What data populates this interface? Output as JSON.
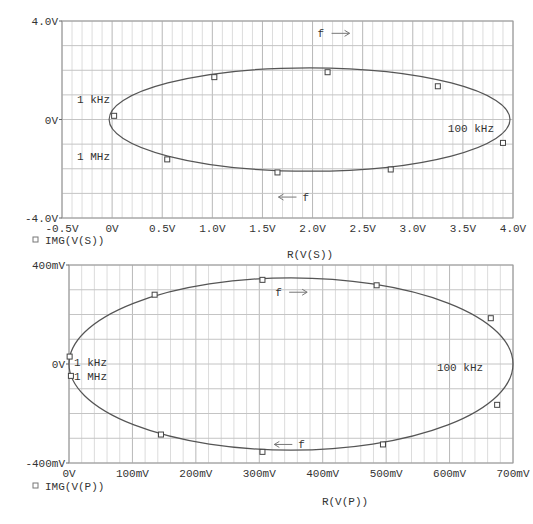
{
  "chart_data": [
    {
      "type": "scatter",
      "subtype": "parametric-nyquist-ellipse",
      "title": "",
      "xlabel": "R(V(S))",
      "ylabel": "",
      "legend": [
        {
          "marker": "square",
          "label": "IMG(V(S))"
        }
      ],
      "xlim": [
        -0.5,
        4.0
      ],
      "ylim": [
        -4.0,
        4.0
      ],
      "x_ticks": [
        "-0.5V",
        "0V",
        "0.5V",
        "1.0V",
        "1.5V",
        "2.0V",
        "2.5V",
        "3.0V",
        "3.5V",
        "4.0V"
      ],
      "y_ticks": [
        "4.0V",
        "0V",
        "-4.0V"
      ],
      "grid": true,
      "curve": {
        "cx": 1.97,
        "cy": 0.0,
        "rx": 2.0,
        "ry": 2.1
      },
      "markers": [
        {
          "x": 0.02,
          "y": 0.15
        },
        {
          "x": 1.02,
          "y": 1.72
        },
        {
          "x": 2.15,
          "y": 1.92
        },
        {
          "x": 3.25,
          "y": 1.35
        },
        {
          "x": 3.9,
          "y": -0.95
        },
        {
          "x": 2.78,
          "y": -2.03
        },
        {
          "x": 1.65,
          "y": -2.15
        },
        {
          "x": 0.55,
          "y": -1.62
        }
      ],
      "annotations": [
        {
          "text": "1 kHz",
          "x": -0.35,
          "y": 0.85
        },
        {
          "text": "1 MHz",
          "x": -0.35,
          "y": -1.5
        },
        {
          "text": "100 kHz",
          "x": 3.35,
          "y": -0.35
        },
        {
          "text": "f",
          "x": 2.05,
          "y": 3.5,
          "arrow": "right"
        },
        {
          "text": "f",
          "x": 1.7,
          "y": -3.15,
          "arrow": "left"
        }
      ]
    },
    {
      "type": "scatter",
      "subtype": "parametric-nyquist-ellipse",
      "title": "",
      "xlabel": "R(V(P))",
      "ylabel": "",
      "legend": [
        {
          "marker": "square",
          "label": "IMG(V(P))"
        }
      ],
      "xlim": [
        0,
        700
      ],
      "ylim": [
        -400,
        400
      ],
      "x_ticks": [
        "0V",
        "100mV",
        "200mV",
        "300mV",
        "400mV",
        "500mV",
        "600mV",
        "700mV"
      ],
      "y_ticks": [
        "400mV",
        "0V",
        "-400mV"
      ],
      "grid": true,
      "curve": {
        "cx": 350,
        "cy": 0,
        "rx": 350,
        "ry": 348
      },
      "markers": [
        {
          "x": 1,
          "y": 30
        },
        {
          "x": 135,
          "y": 280
        },
        {
          "x": 305,
          "y": 340
        },
        {
          "x": 485,
          "y": 318
        },
        {
          "x": 665,
          "y": 185
        },
        {
          "x": 675,
          "y": -165
        },
        {
          "x": 495,
          "y": -325
        },
        {
          "x": 305,
          "y": -355
        },
        {
          "x": 145,
          "y": -285
        },
        {
          "x": 3,
          "y": -48
        }
      ],
      "annotations": [
        {
          "text": "1 kHz",
          "x": 8,
          "y": 10
        },
        {
          "text": "1 MHz",
          "x": 8,
          "y": -48
        },
        {
          "text": "100 kHz",
          "x": 580,
          "y": -12
        },
        {
          "text": "f",
          "x": 325,
          "y": 290,
          "arrow": "right"
        },
        {
          "text": "f",
          "x": 330,
          "y": -325,
          "arrow": "left"
        }
      ]
    }
  ]
}
